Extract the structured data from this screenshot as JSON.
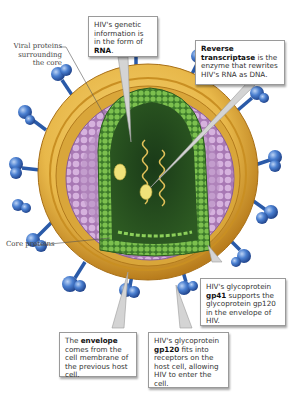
{
  "figure": {
    "colors": {
      "envelope": "#e8b84a",
      "envelope_dark": "#c98f22",
      "matrix_proteins": "#c79ad0",
      "capsid": "#4e9a3a",
      "capsid_interior": "#1f4a1c",
      "rna": "#e3c25a",
      "enzyme": "#f0e27a",
      "glycoprotein": "#3f6fc0",
      "callout_border": "#9a9a9a"
    }
  },
  "labels": {
    "viral_proteins": {
      "line1": "Viral proteins",
      "line2": "surrounding",
      "line3": "the core"
    },
    "core_proteins": "Core proteins"
  },
  "callouts": {
    "rna": {
      "pre": "HIV's genetic information is in the form of ",
      "bold": "RNA",
      "post": "."
    },
    "reverse_transcriptase": {
      "bold": "Reverse transcriptase",
      "post": " is the enzyme that rewrites HIV's RNA as DNA."
    },
    "gp41": {
      "pre": "HIV's glycoprotein ",
      "bold": "gp41",
      "post": " supports the glycoprotein gp120 in the envelope of HIV."
    },
    "envelope": {
      "pre": "The ",
      "bold": "envelope",
      "post": " comes from the cell membrane of the previous host cell."
    },
    "gp120": {
      "pre": "HIV's glycoprotein ",
      "bold": "gp120",
      "post": " fits into receptors on the host cell, allowing HIV to enter the cell."
    }
  }
}
